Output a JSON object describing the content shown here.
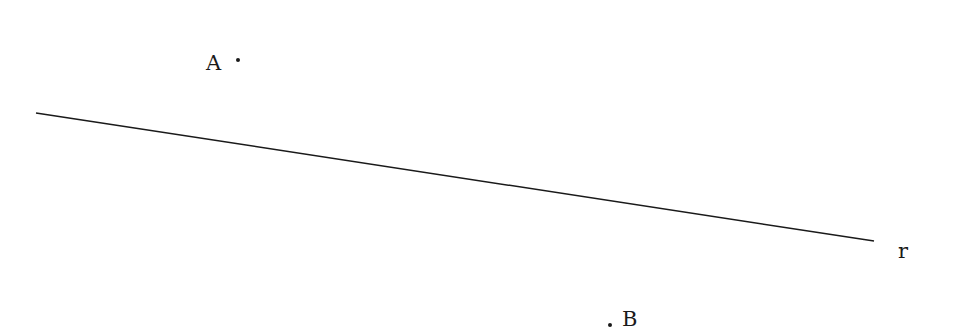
{
  "diagram": {
    "width": 960,
    "height": 333,
    "background": "#ffffff",
    "stroke_color": "#1a1a1a",
    "line": {
      "name": "r",
      "label": "r",
      "x1": 36,
      "y1": 113,
      "x2": 874,
      "y2": 241,
      "label_x": 898,
      "label_y": 258
    },
    "points": [
      {
        "name": "A",
        "label": "A",
        "x": 238,
        "y": 60,
        "label_x": 206,
        "label_y": 70
      },
      {
        "name": "B",
        "label": "B",
        "x": 610,
        "y": 325,
        "label_x": 622,
        "label_y": 326
      }
    ]
  }
}
